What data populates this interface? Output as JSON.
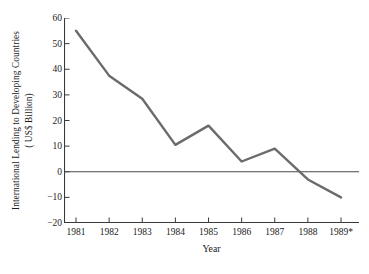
{
  "chart_data": {
    "type": "line",
    "title": "",
    "subtitle": "",
    "xlabel": "Year",
    "ylabel": "International Lending to Developing Countries ( US$ Billion)",
    "ylabel_line1": "International Lending to Developing Countries",
    "ylabel_line2": "( US$ Billion)",
    "categories": [
      "1981",
      "1982",
      "1983",
      "1984",
      "1985",
      "1986",
      "1987",
      "1988",
      "1989*"
    ],
    "x": [
      "1981",
      "1982",
      "1983",
      "1984",
      "1985",
      "1986",
      "1987",
      "1988",
      "1989*"
    ],
    "values": [
      55,
      37.5,
      28.5,
      10.5,
      18,
      4,
      9,
      -3,
      -10
    ],
    "series": [
      {
        "name": "International Lending to Developing Countries",
        "values": [
          55,
          37.5,
          28.5,
          10.5,
          18,
          4,
          9,
          -3,
          -10
        ]
      }
    ],
    "ylim": [
      -20,
      60
    ],
    "yticks": [
      60,
      50,
      40,
      30,
      20,
      10,
      0,
      -10,
      -20
    ],
    "ytick_labels": [
      "60",
      "50",
      "40",
      "30",
      "20",
      "10",
      "0",
      "−10",
      "−20"
    ],
    "xtick_labels": [
      "1981",
      "1982",
      "1983",
      "1984",
      "1985",
      "1986",
      "1987",
      "1988",
      "1989*"
    ],
    "grid": false,
    "legend": false,
    "legend_position": "none",
    "zero_line": true,
    "annotations": [
      "* denotes estimated or projected value for 1989"
    ],
    "line_color": "#6b6b6b",
    "axis_color": "#3a3a3a",
    "zero_line_color": "#4a4a4a",
    "background_color": "#ffffff"
  }
}
